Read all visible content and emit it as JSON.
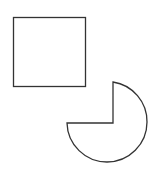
{
  "diagram": {
    "background": "#ffffff",
    "stroke_color": "#333333",
    "shapes": [
      {
        "id": "square",
        "type": "square",
        "x": 13,
        "y": 17,
        "width": 72,
        "height": 69
      },
      {
        "id": "pie",
        "type": "three-quarter-circle",
        "missing_quadrant": "top-left",
        "corner": [
          113,
          123
        ],
        "arc_start": [
          67,
          123
        ],
        "arc_end": [
          113,
          82
        ],
        "radius": 40
      }
    ]
  }
}
